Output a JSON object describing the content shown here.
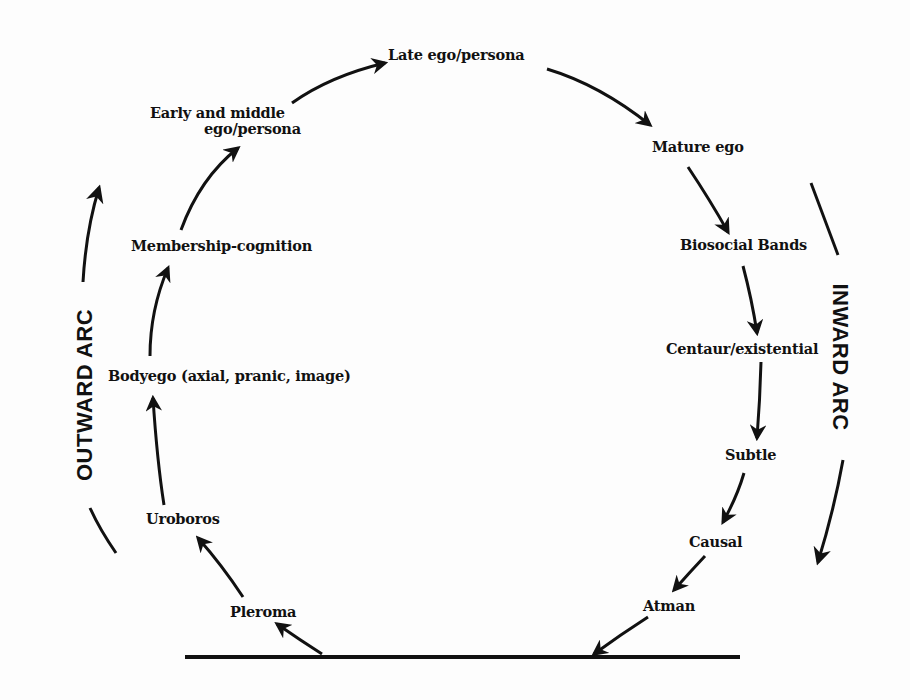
{
  "diagram": {
    "type": "cycle-of-development",
    "arcs": {
      "outward": "OUTWARD ARC",
      "inward": "INWARD ARC"
    },
    "stages": {
      "pleroma": "Pleroma",
      "uroboros": "Uroboros",
      "bodyego": "Bodyego (axial, pranic, image)",
      "membership": "Membership-cognition",
      "early_middle_line1": "Early and middle",
      "early_middle_line2": "ego/persona",
      "late_ego": "Late ego/persona",
      "mature_ego": "Mature ego",
      "biosocial": "Biosocial Bands",
      "centaur": "Centaur/existential",
      "subtle": "Subtle",
      "causal": "Causal",
      "atman": "Atman"
    },
    "sequence": [
      "Pleroma",
      "Uroboros",
      "Bodyego (axial, pranic, image)",
      "Membership-cognition",
      "Early and middle ego/persona",
      "Late ego/persona",
      "Mature ego",
      "Biosocial Bands",
      "Centaur/existential",
      "Subtle",
      "Causal",
      "Atman"
    ],
    "colors": {
      "ink": "#111111",
      "paper": "#fdfdfd"
    }
  }
}
